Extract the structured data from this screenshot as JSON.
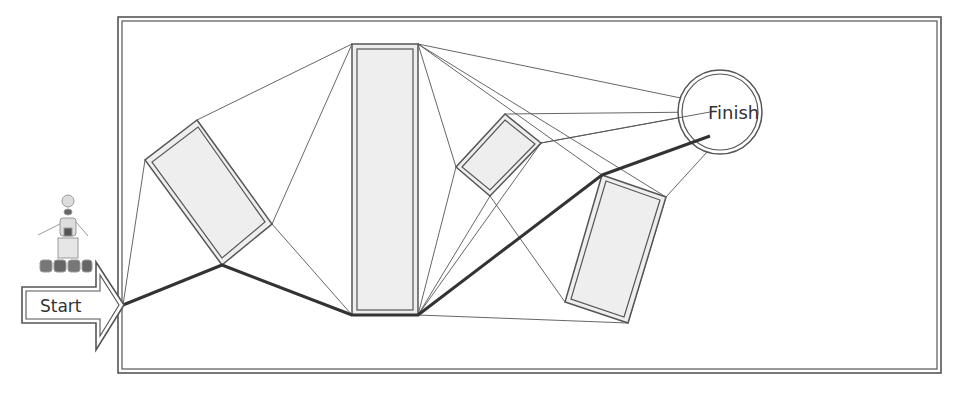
{
  "diagram": {
    "type": "path-planning visibility graph",
    "start_label": "Start",
    "finish_label": "Finish",
    "robot_icon": "robot-icon",
    "colors": {
      "stroke": "#555555",
      "obstacle_fill": "#eeeeee",
      "path": "#333333",
      "background": "#ffffff"
    },
    "obstacles": [
      {
        "name": "obstacle-1",
        "shape": "tilted-rectangle"
      },
      {
        "name": "obstacle-2",
        "shape": "tall-rectangle"
      },
      {
        "name": "obstacle-3",
        "shape": "small-tilted-rectangle"
      },
      {
        "name": "obstacle-4",
        "shape": "tilted-rectangle"
      }
    ],
    "goal": {
      "name": "finish",
      "shape": "circle"
    },
    "optimal_path_node_sequence": [
      "start",
      "obstacle-1.bottom",
      "obstacle-2.bottom-left",
      "obstacle-2.bottom-right",
      "obstacle-4.top-left",
      "finish"
    ]
  }
}
